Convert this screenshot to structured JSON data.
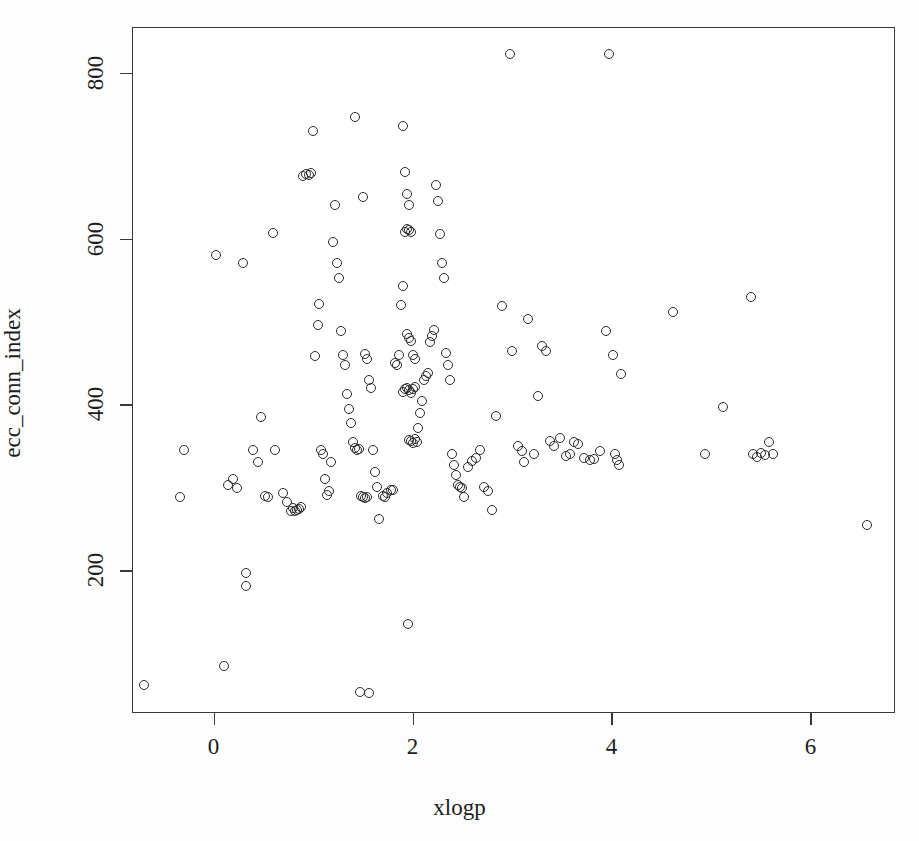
{
  "chart_data": {
    "type": "scatter",
    "title": "",
    "xlabel": "xlogp",
    "ylabel": "ecc_conn_index",
    "xlim": [
      -0.82,
      6.85
    ],
    "ylim": [
      28,
      855
    ],
    "xticks": [
      0,
      2,
      4,
      6
    ],
    "yticks": [
      200,
      400,
      600,
      800
    ],
    "xtick_labels": [
      "0",
      "2",
      "4",
      "6"
    ],
    "ytick_labels": [
      "200",
      "400",
      "600",
      "800"
    ],
    "grid": false,
    "legend": null,
    "marker": "open-circle",
    "marker_color": "#2b2b2b",
    "n_points": 183,
    "points": [
      [
        -0.7,
        62
      ],
      [
        -0.34,
        289
      ],
      [
        -0.3,
        345
      ],
      [
        0.02,
        580
      ],
      [
        0.1,
        85
      ],
      [
        0.14,
        303
      ],
      [
        0.2,
        310
      ],
      [
        0.24,
        299
      ],
      [
        0.3,
        570
      ],
      [
        0.33,
        197
      ],
      [
        0.33,
        181
      ],
      [
        0.4,
        345
      ],
      [
        0.45,
        330
      ],
      [
        0.48,
        385
      ],
      [
        0.52,
        290
      ],
      [
        0.55,
        288
      ],
      [
        0.6,
        607
      ],
      [
        0.62,
        345
      ],
      [
        0.7,
        293
      ],
      [
        0.74,
        282
      ],
      [
        0.78,
        272
      ],
      [
        0.8,
        275
      ],
      [
        0.82,
        271
      ],
      [
        0.84,
        273
      ],
      [
        0.86,
        274
      ],
      [
        0.88,
        276
      ],
      [
        0.9,
        675
      ],
      [
        0.93,
        678
      ],
      [
        0.96,
        677
      ],
      [
        0.98,
        679
      ],
      [
        1.0,
        730
      ],
      [
        1.02,
        458
      ],
      [
        1.05,
        496
      ],
      [
        1.06,
        521
      ],
      [
        1.08,
        345
      ],
      [
        1.1,
        340
      ],
      [
        1.12,
        310
      ],
      [
        1.14,
        291
      ],
      [
        1.16,
        296
      ],
      [
        1.18,
        330
      ],
      [
        1.2,
        596
      ],
      [
        1.22,
        640
      ],
      [
        1.24,
        570
      ],
      [
        1.26,
        552
      ],
      [
        1.28,
        488
      ],
      [
        1.3,
        460
      ],
      [
        1.32,
        447
      ],
      [
        1.34,
        412
      ],
      [
        1.36,
        395
      ],
      [
        1.38,
        378
      ],
      [
        1.4,
        355
      ],
      [
        1.42,
        348
      ],
      [
        1.44,
        345
      ],
      [
        1.46,
        346
      ],
      [
        1.48,
        290
      ],
      [
        1.5,
        288
      ],
      [
        1.52,
        287
      ],
      [
        1.54,
        289
      ],
      [
        1.47,
        53
      ],
      [
        1.56,
        52
      ],
      [
        1.5,
        650
      ],
      [
        1.52,
        461
      ],
      [
        1.54,
        455
      ],
      [
        1.56,
        430
      ],
      [
        1.58,
        420
      ],
      [
        1.6,
        345
      ],
      [
        1.62,
        318
      ],
      [
        1.64,
        300
      ],
      [
        1.66,
        262
      ],
      [
        1.42,
        746
      ],
      [
        1.7,
        290
      ],
      [
        1.72,
        288
      ],
      [
        1.74,
        293
      ],
      [
        1.78,
        297
      ],
      [
        1.8,
        297
      ],
      [
        1.82,
        450
      ],
      [
        1.84,
        447
      ],
      [
        1.86,
        460
      ],
      [
        1.88,
        520
      ],
      [
        1.9,
        543
      ],
      [
        1.92,
        608
      ],
      [
        1.94,
        612
      ],
      [
        1.96,
        610
      ],
      [
        1.98,
        608
      ],
      [
        1.9,
        736
      ],
      [
        1.92,
        680
      ],
      [
        1.94,
        654
      ],
      [
        1.96,
        640
      ],
      [
        1.9,
        415
      ],
      [
        1.92,
        418
      ],
      [
        1.94,
        420
      ],
      [
        1.96,
        417
      ],
      [
        1.98,
        414
      ],
      [
        2.0,
        419
      ],
      [
        2.02,
        421
      ],
      [
        1.94,
        485
      ],
      [
        1.96,
        480
      ],
      [
        1.98,
        477
      ],
      [
        2.0,
        460
      ],
      [
        2.02,
        455
      ],
      [
        1.96,
        357
      ],
      [
        1.98,
        356
      ],
      [
        2.0,
        354
      ],
      [
        2.02,
        358
      ],
      [
        2.04,
        355
      ],
      [
        1.95,
        135
      ],
      [
        2.05,
        372
      ],
      [
        2.08,
        390
      ],
      [
        2.1,
        404
      ],
      [
        2.12,
        430
      ],
      [
        2.14,
        434
      ],
      [
        2.16,
        438
      ],
      [
        2.18,
        475
      ],
      [
        2.2,
        483
      ],
      [
        2.22,
        490
      ],
      [
        2.24,
        665
      ],
      [
        2.26,
        645
      ],
      [
        2.28,
        605
      ],
      [
        2.3,
        570
      ],
      [
        2.32,
        553
      ],
      [
        2.34,
        462
      ],
      [
        2.36,
        447
      ],
      [
        2.38,
        430
      ],
      [
        2.4,
        340
      ],
      [
        2.42,
        327
      ],
      [
        2.44,
        315
      ],
      [
        2.46,
        303
      ],
      [
        2.48,
        300
      ],
      [
        2.5,
        299
      ],
      [
        2.52,
        288
      ],
      [
        2.56,
        325
      ],
      [
        2.6,
        332
      ],
      [
        2.64,
        335
      ],
      [
        2.68,
        345
      ],
      [
        2.72,
        300
      ],
      [
        2.76,
        296
      ],
      [
        2.8,
        273
      ],
      [
        2.84,
        386
      ],
      [
        2.9,
        519
      ],
      [
        2.98,
        822
      ],
      [
        3.0,
        465
      ],
      [
        3.06,
        350
      ],
      [
        3.1,
        344
      ],
      [
        3.12,
        330
      ],
      [
        3.16,
        503
      ],
      [
        3.22,
        340
      ],
      [
        3.26,
        410
      ],
      [
        3.3,
        470
      ],
      [
        3.34,
        465
      ],
      [
        3.38,
        356
      ],
      [
        3.42,
        350
      ],
      [
        3.48,
        360
      ],
      [
        3.54,
        338
      ],
      [
        3.58,
        340
      ],
      [
        3.62,
        355
      ],
      [
        3.66,
        352
      ],
      [
        3.72,
        336
      ],
      [
        3.78,
        333
      ],
      [
        3.82,
        334
      ],
      [
        3.88,
        344
      ],
      [
        3.94,
        489
      ],
      [
        3.97,
        823
      ],
      [
        4.02,
        459
      ],
      [
        4.04,
        340
      ],
      [
        4.06,
        333
      ],
      [
        4.08,
        327
      ],
      [
        4.1,
        437
      ],
      [
        4.62,
        511
      ],
      [
        4.94,
        340
      ],
      [
        5.12,
        397
      ],
      [
        5.4,
        529
      ],
      [
        5.42,
        340
      ],
      [
        5.46,
        337
      ],
      [
        5.5,
        341
      ],
      [
        5.54,
        339
      ],
      [
        5.58,
        355
      ],
      [
        5.62,
        340
      ],
      [
        6.57,
        255
      ]
    ]
  }
}
